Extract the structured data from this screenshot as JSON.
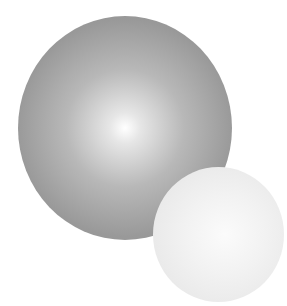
{
  "scene": {
    "description": "Two shaded spheres on white background",
    "background": "#ffffff",
    "spheres": [
      {
        "name": "large-gray-sphere",
        "color": "#9a9a9a",
        "highlight": "#ffffff"
      },
      {
        "name": "small-white-sphere",
        "color": "#e6e6e6",
        "highlight": "#fafafa"
      }
    ]
  }
}
